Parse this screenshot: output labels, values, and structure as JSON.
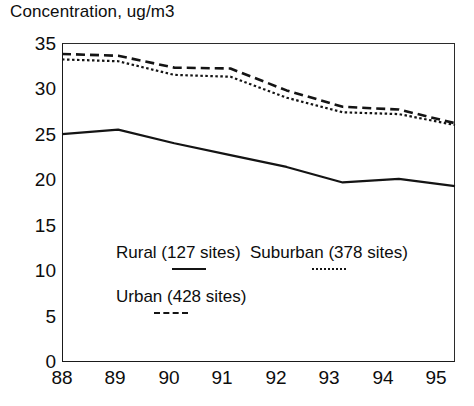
{
  "chart_data": {
    "type": "line",
    "title": "Concentration, ug/m3",
    "xlabel": "",
    "ylabel": "",
    "x": [
      "88",
      "89",
      "90",
      "91",
      "92",
      "93",
      "94",
      "95"
    ],
    "categories": [
      "88",
      "89",
      "90",
      "91",
      "92",
      "93",
      "94",
      "95"
    ],
    "series": [
      {
        "name": "Rural (127 sites)",
        "style": "solid",
        "values": [
          25.0,
          25.5,
          24.0,
          22.7,
          21.4,
          19.7,
          20.1,
          19.3
        ]
      },
      {
        "name": "Suburban (378 sites)",
        "style": "dotted",
        "values": [
          33.2,
          33.0,
          31.5,
          31.3,
          29.0,
          27.4,
          27.2,
          26.0
        ]
      },
      {
        "name": "Urban (428 sites)",
        "style": "dashed",
        "values": [
          33.8,
          33.6,
          32.3,
          32.2,
          29.8,
          28.0,
          27.7,
          26.2
        ]
      }
    ],
    "ylim": [
      0,
      35
    ],
    "yticks": [
      0,
      5,
      10,
      15,
      20,
      25,
      30,
      35
    ],
    "ytick_labels": [
      "0",
      "5",
      "10",
      "15",
      "20",
      "25",
      "30",
      "35"
    ],
    "xtick_labels": [
      "88",
      "89",
      "90",
      "91",
      "92",
      "93",
      "94",
      "95"
    ],
    "grid": false,
    "legend_position": "inside-lower-left",
    "line_color": "#141414"
  },
  "legend": {
    "rural": "Rural (127 sites)",
    "suburban": "Suburban (378 sites)",
    "urban": "Urban (428 sites)"
  },
  "axes": {
    "y_labels": [
      "35",
      "30",
      "25",
      "20",
      "15",
      "10",
      "5",
      "0"
    ],
    "x_labels": [
      "88",
      "89",
      "90",
      "91",
      "92",
      "93",
      "94",
      "95"
    ]
  }
}
